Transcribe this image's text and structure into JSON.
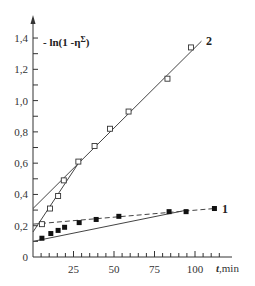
{
  "chart_data": {
    "type": "scatter",
    "title": "",
    "ylabel": "- ln(1 -η",
    "ylabel_superscript": "Σ",
    "ylabel_close": ")",
    "xlabel_var": "t",
    "xlabel_unit": ",min",
    "xlim": [
      0,
      120
    ],
    "ylim": [
      0,
      1.5
    ],
    "grid": false,
    "legend": "inline labels at line ends",
    "x_ticks": [
      25,
      50,
      75,
      100
    ],
    "x_tick_labels": [
      "25",
      "50",
      "75",
      "100"
    ],
    "y_ticks": [
      0,
      0.2,
      0.4,
      0.6,
      0.8,
      1.0,
      1.2,
      1.4
    ],
    "y_tick_labels": [
      "0",
      "0,2",
      "0,4",
      "0,6",
      "0,8",
      "1,0",
      "1,2",
      "1,4"
    ],
    "series": [
      {
        "name": "1",
        "marker": "filled-square",
        "x": [
          5.5,
          11,
          15.5,
          19.5,
          28.5,
          39,
          53,
          84,
          94.5,
          112
        ],
        "y": [
          0.12,
          0.15,
          0.17,
          0.19,
          0.22,
          0.24,
          0.26,
          0.29,
          0.29,
          0.31
        ],
        "fit_lines": [
          {
            "style": "solid",
            "from": [
              0,
              0.1
            ],
            "to": [
              95,
              0.3
            ]
          },
          {
            "style": "dashed",
            "from": [
              0,
              0.21
            ],
            "to": [
              112,
              0.31
            ]
          }
        ]
      },
      {
        "name": "2",
        "marker": "open-square",
        "x": [
          5.5,
          10.5,
          15.5,
          19,
          28,
          38,
          47.5,
          59,
          83,
          97.5
        ],
        "y": [
          0.21,
          0.31,
          0.39,
          0.49,
          0.61,
          0.71,
          0.82,
          0.93,
          1.14,
          1.34
        ],
        "fit_lines": [
          {
            "style": "solid",
            "from": [
              0,
              0.16
            ],
            "to": [
              30,
              0.63
            ]
          },
          {
            "style": "solid",
            "from": [
              0,
              0.31
            ],
            "to": [
              104,
              1.38
            ]
          }
        ]
      }
    ]
  }
}
